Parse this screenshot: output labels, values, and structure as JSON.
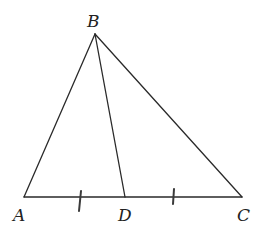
{
  "diagram": {
    "type": "triangle-with-median",
    "points": {
      "A": {
        "label": "A",
        "x": 24,
        "y": 197
      },
      "B": {
        "label": "B",
        "x": 95,
        "y": 34
      },
      "C": {
        "label": "C",
        "x": 242,
        "y": 197
      },
      "D": {
        "label": "D",
        "x": 125,
        "y": 197
      }
    },
    "segments": [
      {
        "from": "A",
        "to": "B"
      },
      {
        "from": "B",
        "to": "C"
      },
      {
        "from": "A",
        "to": "C"
      },
      {
        "from": "B",
        "to": "D"
      }
    ],
    "congruence_marks": [
      {
        "segment": "AD",
        "ticks": 1
      },
      {
        "segment": "DC",
        "ticks": 1
      }
    ],
    "colors": {
      "line": "#2a2a2a",
      "background": "#ffffff"
    }
  }
}
